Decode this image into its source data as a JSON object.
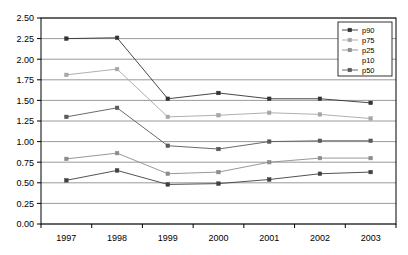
{
  "chart_data": {
    "type": "line",
    "title": "",
    "xlabel": "",
    "ylabel": "",
    "categories": [
      "1997",
      "1998",
      "1999",
      "2000",
      "2001",
      "2002",
      "2003"
    ],
    "x": [
      1997,
      1998,
      1999,
      2000,
      2001,
      2002,
      2003
    ],
    "ylim": [
      0.0,
      2.5
    ],
    "yticks": [
      "0.00",
      "0.25",
      "0.50",
      "0.75",
      "1.00",
      "1.25",
      "1.50",
      "1.75",
      "2.00",
      "2.25",
      "2.50"
    ],
    "ytick_values": [
      0.0,
      0.25,
      0.5,
      0.75,
      1.0,
      1.25,
      1.5,
      1.75,
      2.0,
      2.25,
      2.5
    ],
    "grid": "horizontal",
    "legend_position": "top-right",
    "marker": "square",
    "series": [
      {
        "name": "p90",
        "color": "#333333",
        "values": [
          2.25,
          2.26,
          1.52,
          1.59,
          1.52,
          1.52,
          1.47
        ]
      },
      {
        "name": "p75",
        "color": "#a6a6a6",
        "values": [
          1.81,
          1.88,
          1.3,
          1.32,
          1.35,
          1.33,
          1.28
        ]
      },
      {
        "name": "p25",
        "color": "#8c8c8c",
        "values": [
          0.79,
          0.86,
          0.61,
          0.63,
          0.75,
          0.8,
          0.8
        ]
      },
      {
        "name": "p10",
        "color": "#404040",
        "values": [
          0.53,
          0.65,
          0.48,
          0.49,
          0.54,
          0.61,
          0.63
        ]
      },
      {
        "name": "p50",
        "color": "#595959",
        "values": [
          1.3,
          1.41,
          0.95,
          0.91,
          1.0,
          1.01,
          1.01
        ]
      }
    ],
    "legend_entries": [
      {
        "label": "p90",
        "color": "#333333"
      },
      {
        "label": "p75",
        "color": "#a6a6a6"
      },
      {
        "label": "p25",
        "color": "#8c8c8c"
      },
      {
        "label": "p10",
        "color": "#404040"
      },
      {
        "label": "p50",
        "color": "#595959"
      }
    ]
  },
  "style": {
    "plot_border_color": "#000000",
    "grid_color": "#808080",
    "background": "#ffffff"
  }
}
